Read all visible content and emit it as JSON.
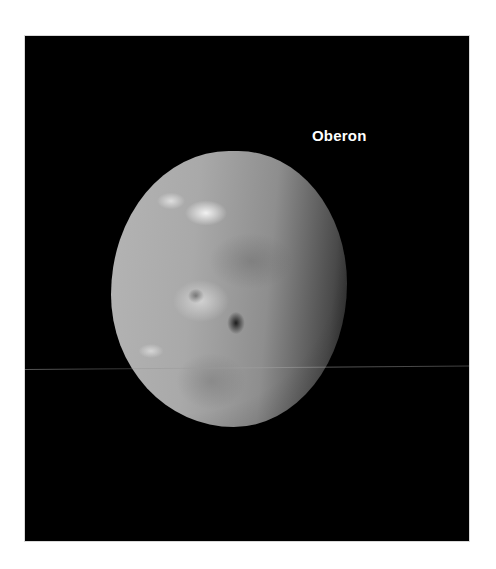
{
  "image": {
    "subject": "moon-photograph",
    "label": "Oberon",
    "background_color": "#000000",
    "page_color": "#ffffff",
    "label_color": "#ffffff"
  }
}
